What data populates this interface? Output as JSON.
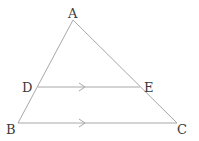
{
  "diagram": {
    "type": "geometry-triangle",
    "points": {
      "A": {
        "label": "A"
      },
      "B": {
        "label": "B"
      },
      "C": {
        "label": "C"
      },
      "D": {
        "label": "D"
      },
      "E": {
        "label": "E"
      }
    },
    "segments": [
      {
        "from": "A",
        "to": "B"
      },
      {
        "from": "A",
        "to": "C"
      },
      {
        "from": "D",
        "to": "E",
        "parallel_mark": true
      },
      {
        "from": "B",
        "to": "C",
        "parallel_mark": true
      }
    ],
    "relations": [
      "DE ∥ BC",
      "D on AB",
      "E on AC"
    ],
    "colors": {
      "line": "#a8a8a8",
      "label": "#3a3a3a",
      "background": "#ffffff"
    }
  }
}
